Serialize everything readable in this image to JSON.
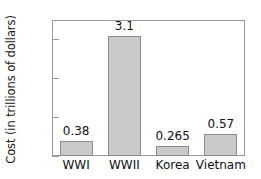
{
  "chart_data": {
    "type": "bar",
    "title": "",
    "xlabel": "",
    "ylabel": "Cost (in trillions of dollars)",
    "categories": [
      "WWI",
      "WWII",
      "Korea",
      "Vietnam"
    ],
    "values": [
      0.38,
      3.1,
      0.265,
      0.57
    ],
    "value_labels": [
      "0.38",
      "3.1",
      "0.265",
      "0.57"
    ],
    "ylim": [
      0,
      3.5
    ],
    "yticks": [
      0,
      1,
      2,
      3
    ],
    "ytick_labels": [
      "0",
      "1",
      "2",
      "3"
    ],
    "grid": false,
    "legend": false,
    "bar_color": "#c9c9c9",
    "bar_border_color": "#8d8d8d",
    "axis_color": "#9a9a9a",
    "text_color": "#111111"
  }
}
